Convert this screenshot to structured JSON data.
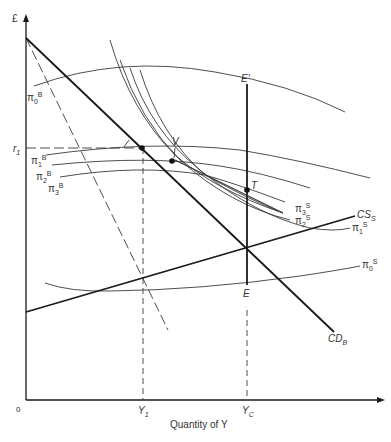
{
  "axes": {
    "y_label": "£",
    "x_label": "Quantity of Y",
    "origin_label": "0",
    "x_ticks": [
      {
        "label": "Y",
        "sub": "1"
      },
      {
        "label": "Y",
        "sub": "C"
      }
    ],
    "y_ticks": [
      {
        "label": "r",
        "sub": "1"
      }
    ]
  },
  "curves": {
    "cd": {
      "label": "CD",
      "sub": "B"
    },
    "cs": {
      "label": "CS",
      "sub": "S"
    },
    "pi0b": {
      "label": "π",
      "sub": "0",
      "sup": "B"
    },
    "pi1b": {
      "label": "π",
      "sub": "1",
      "sup": "B"
    },
    "pi2b": {
      "label": "π",
      "sub": "2",
      "sup": "B"
    },
    "pi3b": {
      "label": "π",
      "sub": "3",
      "sup": "B"
    },
    "pi0s": {
      "label": "π",
      "sub": "0",
      "sup": "S"
    },
    "pi1s": {
      "label": "π",
      "sub": "1",
      "sup": "S"
    },
    "pi2s": {
      "label": "π",
      "sub": "2",
      "sup": "S"
    },
    "pi3s": {
      "label": "π",
      "sub": "3",
      "sup": "S"
    }
  },
  "points": {
    "e_prime": "E'",
    "e": "E",
    "v": "V",
    "t": "T",
    "j": "J"
  }
}
